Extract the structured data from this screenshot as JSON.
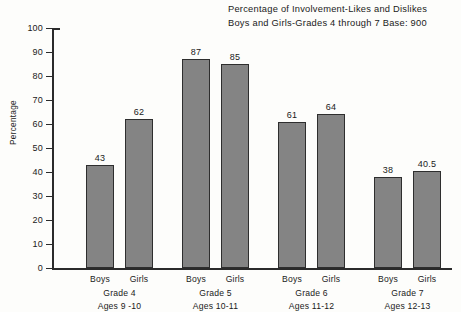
{
  "title": {
    "line1": "Percentage of Involvement-Likes and Dislikes",
    "line2": "Boys and Girls-Grades 4 through 7 Base: 900"
  },
  "chart_data": {
    "type": "bar",
    "title": "Percentage of Involvement-Likes and Dislikes Boys and Girls-Grades 4 through 7 Base: 900",
    "xlabel": "",
    "ylabel": "Percentage",
    "ylim": [
      0,
      100
    ],
    "ytick_step": 10,
    "yticks": [
      0,
      10,
      20,
      30,
      40,
      50,
      60,
      70,
      80,
      90,
      100
    ],
    "grid": false,
    "legend": "none",
    "categories": [
      "Grade 4",
      "Grade 5",
      "Grade 6",
      "Grade 7"
    ],
    "category_sublabels": [
      "Ages 9 -10",
      "Ages 10-11",
      "Ages 11-12",
      "Ages 12-13"
    ],
    "series": [
      {
        "name": "Boys",
        "values": [
          43,
          87,
          61,
          38
        ]
      },
      {
        "name": "Girls",
        "values": [
          62,
          85,
          64,
          40.5
        ]
      }
    ],
    "bar_color": "#848484",
    "bar_edge_color": "#2e2e2e",
    "groups": [
      {
        "grade": "Grade 4",
        "ages": "Ages 9 -10",
        "bars": [
          {
            "series": "Boys",
            "value": 43,
            "label": "43"
          },
          {
            "series": "Girls",
            "value": 62,
            "label": "62"
          }
        ]
      },
      {
        "grade": "Grade 5",
        "ages": "Ages 10-11",
        "bars": [
          {
            "series": "Boys",
            "value": 87,
            "label": "87"
          },
          {
            "series": "Girls",
            "value": 85,
            "label": "85"
          }
        ]
      },
      {
        "grade": "Grade 6",
        "ages": "Ages 11-12",
        "bars": [
          {
            "series": "Boys",
            "value": 61,
            "label": "61"
          },
          {
            "series": "Girls",
            "value": 64,
            "label": "64"
          }
        ]
      },
      {
        "grade": "Grade 7",
        "ages": "Ages 12-13",
        "bars": [
          {
            "series": "Boys",
            "value": 38,
            "label": "38"
          },
          {
            "series": "Girls",
            "value": 40.5,
            "label": "40.5"
          }
        ]
      }
    ]
  }
}
